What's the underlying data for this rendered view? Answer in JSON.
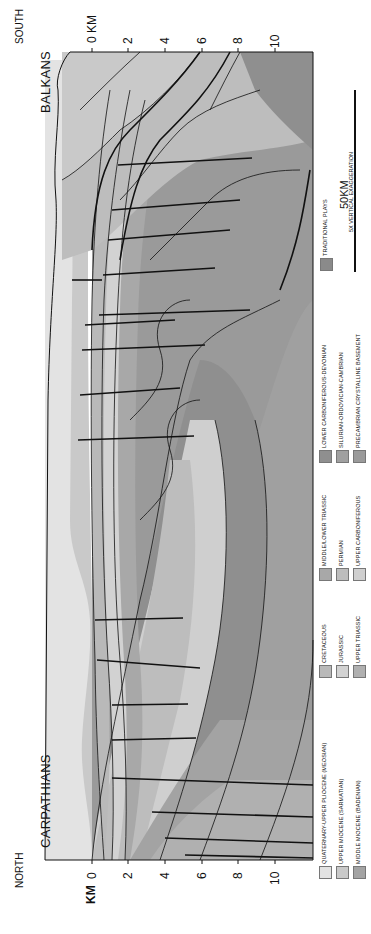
{
  "figure": {
    "type": "geological cross-section (rotated 90° counter-clockwise)",
    "orientation": {
      "north_label": "NORTH",
      "south_label": "SOUTH"
    },
    "regions": {
      "left_region": "CARPATHIANS",
      "right_region": "BALKANS"
    },
    "depth_axis_left": {
      "unit_label": "KM",
      "ticks": [
        "0",
        "2",
        "4",
        "6",
        "8",
        "10"
      ]
    },
    "depth_axis_right": {
      "unit_label": "0 KM",
      "ticks": [
        "2",
        "4",
        "6",
        "8",
        "10"
      ]
    },
    "scale_bar": {
      "label": "50KM",
      "sublabel": "5X VERTICAL EXAGGERATION"
    },
    "legend": [
      {
        "label": "QUATERNARY-UPPER PLIOCENE (MEOSIAN)",
        "color": "#e3e3e3"
      },
      {
        "label": "UPPER MIOCENE (SARMATIAN)",
        "color": "#c9c9c9"
      },
      {
        "label": "MIDDLE MIOCENE (BADENIAN)",
        "color": "#a3a3a3"
      },
      {
        "label": "CRETACEOUS",
        "color": "#b9b9b9"
      },
      {
        "label": "JURASSIC",
        "color": "#d2d2d2"
      },
      {
        "label": "UPPER TRIASSIC",
        "color": "#b0b0b0"
      },
      {
        "label": "MIDDLE/LOWER TRIASSIC",
        "color": "#a8a8a8"
      },
      {
        "label": "PERMIAN",
        "color": "#bdbdbd"
      },
      {
        "label": "UPPER CARBONIFEROUS",
        "color": "#cfcfcf"
      },
      {
        "label": "LOWER CARBONIFEROUS-DEVONIAN",
        "color": "#8f8f8f"
      },
      {
        "label": "SILURIAN-ORDOVICIAN-CAMBRIAN",
        "color": "#a0a0a0"
      },
      {
        "label": "PRECAMBRIAN CRYSTALLINE BASEMENT",
        "color": "#9a9a9a"
      },
      {
        "label": "TRADITIONAL PLAYS",
        "color": "#8a8a8a"
      }
    ]
  }
}
